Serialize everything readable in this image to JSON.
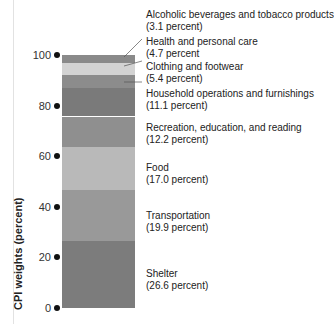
{
  "chart_data": {
    "type": "bar",
    "subtype": "stacked-single",
    "title": "",
    "xlabel": "",
    "ylabel": "CPI weights (percent)",
    "ylim": [
      0,
      100
    ],
    "yticks": [
      0,
      20,
      40,
      60,
      80,
      100
    ],
    "grid": false,
    "legend": "direct labels right of bar",
    "segments": [
      {
        "name": "Shelter",
        "value": 26.6,
        "label": "Shelter",
        "pct_label": "(26.6 percent)",
        "color": "#7c7c7c"
      },
      {
        "name": "Transportation",
        "value": 19.9,
        "label": "Transportation",
        "pct_label": "(19.9 percent)",
        "color": "#999999"
      },
      {
        "name": "Food",
        "value": 17.0,
        "label": "Food",
        "pct_label": "(17.0 percent)",
        "color": "#b9b9b9"
      },
      {
        "name": "Recreation, education, and reading",
        "value": 12.2,
        "label": "Recreation, education, and reading",
        "pct_label": "(12.2 percent)",
        "color": "#8f8f8f"
      },
      {
        "name": "Household operations and furnishings",
        "value": 11.1,
        "label": "Household operations and furnishings",
        "pct_label": "(11.1 percent)",
        "color": "#7a7a7a"
      },
      {
        "name": "Clothing and footwear",
        "value": 5.4,
        "label": "Clothing and footwear",
        "pct_label": "(5.4 percent)",
        "color": "#8c8c8c"
      },
      {
        "name": "Health and personal care",
        "value": 4.7,
        "label": "Health and personal care",
        "pct_label": "(4.7 percent",
        "color": "#d3d3d3"
      },
      {
        "name": "Alcoholic beverages and tobacco products",
        "value": 3.1,
        "label": "Alcoholic beverages and tobacco products",
        "pct_label": "(3.1 percent)",
        "color": "#8a8a8a"
      }
    ]
  },
  "axis": {
    "ylabel": "CPI weights (percent)",
    "ticks": [
      "0",
      "20",
      "40",
      "60",
      "80",
      "100"
    ]
  }
}
